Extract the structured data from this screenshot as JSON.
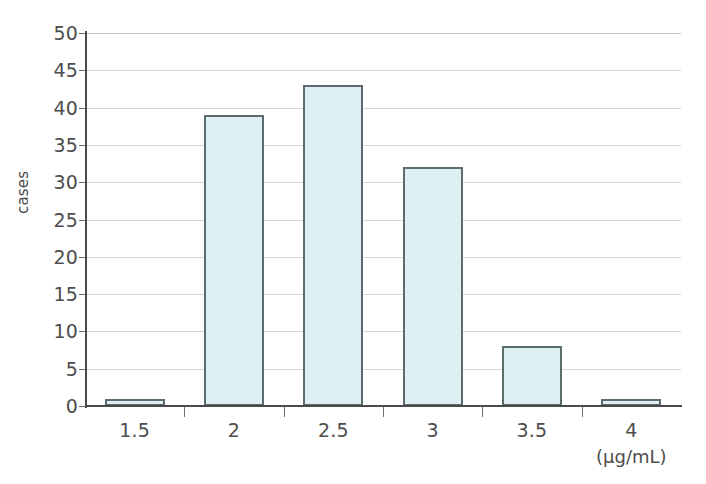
{
  "chart_data": {
    "type": "bar",
    "title": "",
    "xlabel": "(μg/mL)",
    "ylabel": "cases",
    "categories": [
      "1.5",
      "2",
      "2.5",
      "3",
      "3.5",
      "4"
    ],
    "values": [
      1,
      39,
      43,
      32,
      8,
      1
    ],
    "ylim": [
      0,
      50
    ],
    "ytick_values": [
      0,
      5,
      10,
      15,
      20,
      25,
      30,
      35,
      40,
      45,
      50
    ],
    "ytick_labels": [
      "0",
      "5",
      "10",
      "15",
      "20",
      "25",
      "30",
      "35",
      "40",
      "45",
      "50"
    ],
    "xtick_labels": [
      "1.5",
      "2",
      "2.5",
      "3",
      "3.5",
      "4"
    ],
    "grid": true,
    "legend": false,
    "bar_fill_color": "#dff0f2",
    "bar_border_color": "#5c6b6e",
    "gridline_color": "#d6d6d6",
    "axis_color": "#4a4a4a",
    "text_color": "#4d4d4d",
    "background_color": "#ffffff"
  },
  "axes": {
    "y_title": "cases",
    "x_unit": "(μg/mL)"
  }
}
